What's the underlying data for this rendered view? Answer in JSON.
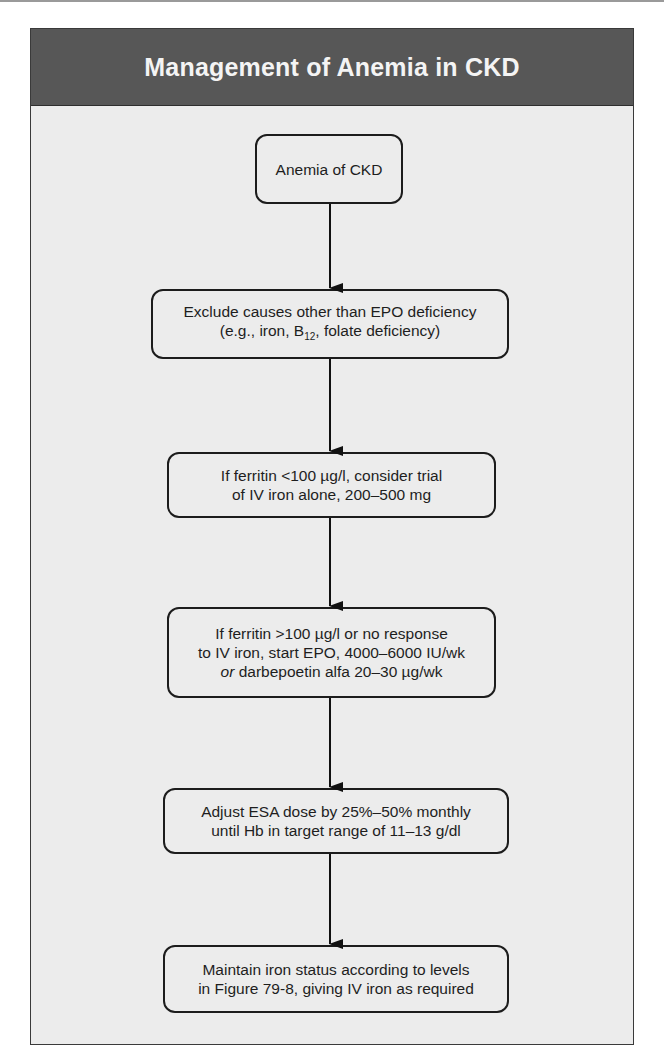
{
  "title": "Management of Anemia in CKD",
  "nodes": [
    {
      "lines": [
        "Anemia of CKD"
      ]
    },
    {
      "lines": [
        "Exclude causes other than EPO deficiency",
        "(e.g., iron, B12, folate deficiency)"
      ]
    },
    {
      "lines": [
        "If ferritin <100 µg/l, consider trial",
        "of IV iron alone, 200–500 mg"
      ]
    },
    {
      "lines": [
        "If ferritin >100 µg/l or no response",
        "to IV iron, start EPO, 4000–6000 IU/wk",
        "or darbepoetin alfa 20–30 µg/wk"
      ]
    },
    {
      "lines": [
        "Adjust ESA dose by 25%–50% monthly",
        "until Hb in target range of 11–13 g/dl"
      ]
    },
    {
      "lines": [
        "Maintain iron status according to levels",
        "in Figure 79-8, giving IV iron as required"
      ]
    }
  ],
  "colors": {
    "header": "#575757",
    "body": "#ececec",
    "stroke": "#1c1c1c"
  }
}
